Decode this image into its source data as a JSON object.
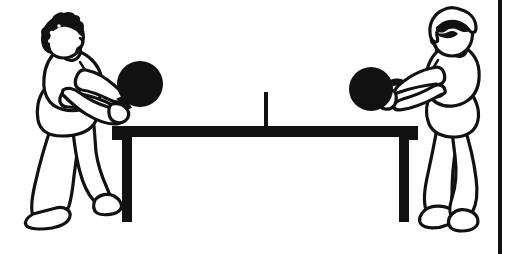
{
  "image": {
    "title": "Table tennis rally illustration",
    "alt_text": "Two people playing table tennis on opposite sides of a table, each holding a dark paddle",
    "style": "black-and-white line art clip art",
    "background_color": "#ffffff",
    "ink_color": "#111111",
    "width": 511,
    "height": 254
  },
  "border": {
    "name": "right-edge-rule",
    "orientation": "vertical",
    "color": "#111111",
    "x": 498,
    "thickness": 4
  },
  "scene": {
    "table": {
      "label": "table-tennis-table",
      "top_color": "#111111",
      "top_left_x": 112,
      "top_right_x": 418,
      "top_y": 126,
      "top_height": 11,
      "legs": [
        {
          "label": "left-table-leg",
          "x": 122,
          "width": 10,
          "bottom_y": 222
        },
        {
          "label": "right-table-leg",
          "x": 399,
          "width": 10,
          "bottom_y": 222
        }
      ],
      "net": {
        "label": "table-net",
        "x": 264,
        "top_y": 92,
        "bottom_y": 128,
        "width": 4,
        "color": "#111111"
      }
    },
    "players": [
      {
        "id": "left-player",
        "label": "Player on the left",
        "facing": "right",
        "hair": "dark curly hair",
        "hair_style": "filled",
        "paddle": {
          "label": "left-paddle",
          "shape": "circle",
          "color": "#111111",
          "cx": 140,
          "cy": 84,
          "r": 23
        },
        "pose": "leaning forward, both arms extended holding paddle"
      },
      {
        "id": "right-player",
        "label": "Player on the right",
        "facing": "left",
        "hair": "outlined hair with dark fringe",
        "hair_style": "outlined",
        "paddle": {
          "label": "right-paddle",
          "shape": "circle",
          "color": "#111111",
          "cx": 371,
          "cy": 89,
          "r": 22
        },
        "pose": "leaning forward, arms extended holding paddle with visible handle"
      }
    ]
  }
}
